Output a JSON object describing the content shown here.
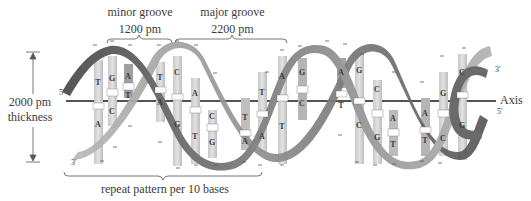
{
  "annotations": {
    "minor_groove": {
      "label": "minor groove",
      "value": "1200 pm"
    },
    "major_groove": {
      "label": "major groove",
      "value": "2200 pm"
    },
    "thickness": {
      "value": "2000 pm",
      "label": "thickness"
    },
    "axis": "Axis",
    "repeat": "repeat pattern per 10 bases"
  },
  "strand_ends": {
    "left_top": "5'",
    "left_bottom": "3'",
    "right_top": "3'",
    "right_bottom": "5'"
  },
  "phosphate_charge": "−",
  "base_pairs": [
    {
      "top": "T",
      "bottom": "A",
      "x": 98
    },
    {
      "top": "G",
      "bottom": "C",
      "x": 112
    },
    {
      "top": "A",
      "bottom": "T",
      "x": 128
    },
    {
      "top": "T",
      "bottom": "A",
      "x": 160
    },
    {
      "top": "C",
      "bottom": "G",
      "x": 177
    },
    {
      "top": "A",
      "bottom": "T",
      "x": 195
    },
    {
      "top": "C",
      "bottom": "G",
      "x": 212
    },
    {
      "top": "T",
      "bottom": "A",
      "x": 245
    },
    {
      "top": "T",
      "bottom": "A",
      "x": 262
    },
    {
      "top": "A",
      "bottom": "T",
      "x": 282
    },
    {
      "top": "G",
      "bottom": "C",
      "x": 302
    },
    {
      "top": "A",
      "bottom": "T",
      "x": 341
    },
    {
      "top": "G",
      "bottom": "C",
      "x": 359
    },
    {
      "top": "C",
      "bottom": "G",
      "x": 377
    },
    {
      "top": "A",
      "bottom": "T",
      "x": 393
    },
    {
      "top": "A",
      "bottom": "T",
      "x": 425
    },
    {
      "top": "G",
      "bottom": "C",
      "x": 443
    },
    {
      "top": "C",
      "bottom": "G",
      "x": 462
    }
  ],
  "colors": {
    "ribbon_dark": "#5f5f5f",
    "ribbon_light": "#b5b5b5",
    "base_light": "#d8d8d8",
    "base_dark": "#a8a8a8",
    "axis_line": "#1a1a1a"
  }
}
